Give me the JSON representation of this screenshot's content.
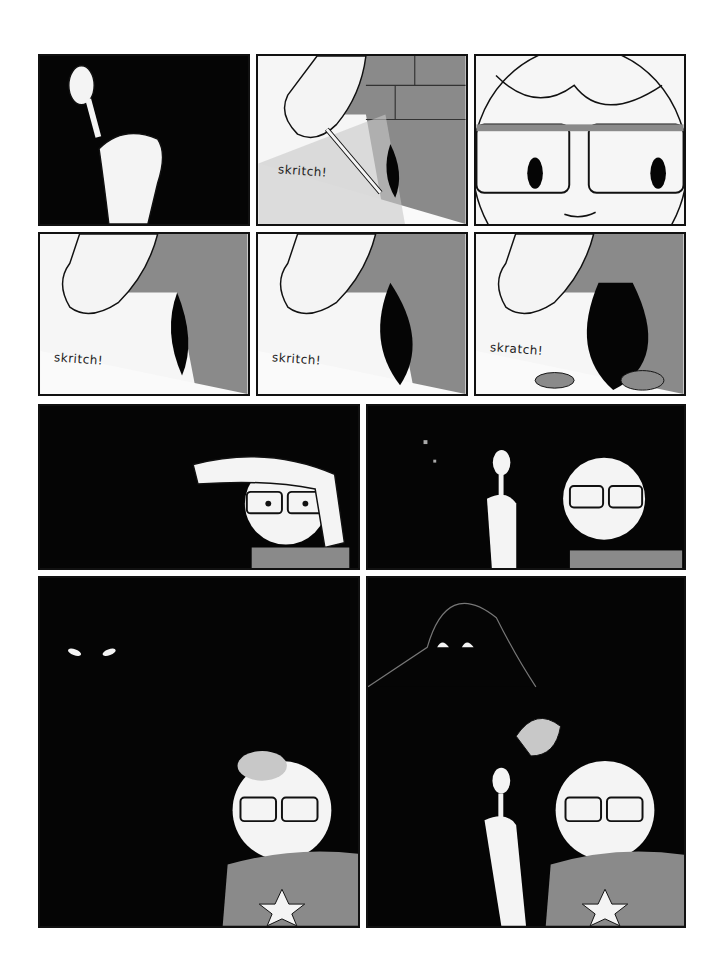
{
  "page": {
    "type": "comic-page",
    "background": "#ffffff",
    "panel_count": 10
  },
  "rows": [
    {
      "panels": [
        {
          "id": "p1",
          "description": "hand holding a spoon against black background",
          "sfx": ""
        },
        {
          "id": "p2",
          "description": "hand scraping brick wall with spoon",
          "sfx": "skritch!"
        },
        {
          "id": "p3",
          "description": "close-up of face with glasses, sweat drop",
          "sfx": ""
        }
      ]
    },
    {
      "panels": [
        {
          "id": "p4",
          "description": "scraping wall, hole growing",
          "sfx": "skritch!"
        },
        {
          "id": "p5",
          "description": "scraping wall, hole larger",
          "sfx": "skritch!"
        },
        {
          "id": "p6",
          "description": "scraping wall, big hole with debris",
          "sfx": "skratch!"
        }
      ]
    },
    {
      "panels": [
        {
          "id": "p7",
          "description": "character wiping brow in the dark",
          "sfx": ""
        },
        {
          "id": "p8",
          "description": "character holding spoon up, debris falling",
          "sfx": ""
        }
      ]
    },
    {
      "panels": [
        {
          "id": "p9",
          "description": "glowing eyes in the dark behind character",
          "sfx": ""
        },
        {
          "id": "p10",
          "description": "shadowy creature looming behind character holding spoon",
          "sfx": ""
        }
      ]
    }
  ],
  "colors": {
    "ink": "#050505",
    "gray_wall": "#8a8a8a",
    "light_gray": "#c8c8c8",
    "skin": "#f4f4f4"
  }
}
